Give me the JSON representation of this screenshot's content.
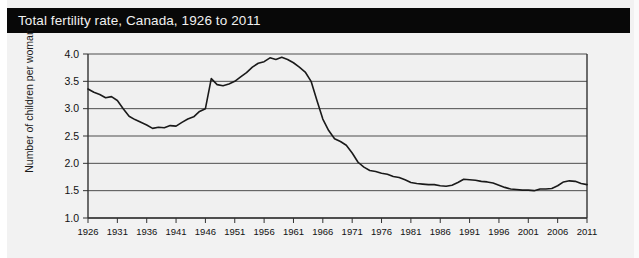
{
  "title": "Total fertility rate, Canada, 1926 to 2011",
  "axes": {
    "ylabel": "Number of children per woman",
    "yticks": [
      "1.0",
      "1.5",
      "2.0",
      "2.5",
      "3.0",
      "3.5",
      "4.0"
    ],
    "xticks": [
      "1926",
      "1931",
      "1936",
      "1941",
      "1946",
      "1951",
      "1956",
      "1961",
      "1966",
      "1971",
      "1976",
      "1981",
      "1986",
      "1991",
      "1996",
      "2001",
      "2006",
      "2011"
    ]
  },
  "colors": {
    "title_bar": "#080808",
    "title_text": "#f0f0f0",
    "figure_background": "#f2f2f2",
    "plot_background": "#f0f0f0",
    "line": "#1a1a1a",
    "grid": "#4d4d4d",
    "axis": "#333333"
  },
  "caption": "",
  "chart_data": {
    "type": "line",
    "title": "Total fertility rate, Canada, 1926 to 2011",
    "xlabel": "",
    "ylabel": "Number of children per woman",
    "xlim": [
      1926,
      2011
    ],
    "ylim": [
      1.0,
      4.0
    ],
    "ytick_step": 0.5,
    "xtick_step": 5,
    "grid": true,
    "legend": false,
    "series": [
      {
        "name": "Total fertility rate",
        "x": [
          1926,
          1927,
          1928,
          1929,
          1930,
          1931,
          1932,
          1933,
          1934,
          1935,
          1936,
          1937,
          1938,
          1939,
          1940,
          1941,
          1942,
          1943,
          1944,
          1945,
          1946,
          1947,
          1948,
          1949,
          1950,
          1951,
          1952,
          1953,
          1954,
          1955,
          1956,
          1957,
          1958,
          1959,
          1960,
          1961,
          1962,
          1963,
          1964,
          1965,
          1966,
          1967,
          1968,
          1969,
          1970,
          1971,
          1972,
          1973,
          1974,
          1975,
          1976,
          1977,
          1978,
          1979,
          1980,
          1981,
          1982,
          1983,
          1984,
          1985,
          1986,
          1987,
          1988,
          1989,
          1990,
          1991,
          1992,
          1993,
          1994,
          1995,
          1996,
          1997,
          1998,
          1999,
          2000,
          2001,
          2002,
          2003,
          2004,
          2005,
          2006,
          2007,
          2008,
          2009,
          2010,
          2011
        ],
        "y": [
          3.36,
          3.3,
          3.26,
          3.2,
          3.22,
          3.15,
          3.0,
          2.86,
          2.8,
          2.75,
          2.7,
          2.64,
          2.66,
          2.65,
          2.69,
          2.68,
          2.75,
          2.81,
          2.85,
          2.95,
          3.0,
          3.55,
          3.44,
          3.42,
          3.45,
          3.5,
          3.58,
          3.66,
          3.76,
          3.83,
          3.86,
          3.93,
          3.9,
          3.94,
          3.9,
          3.84,
          3.76,
          3.67,
          3.5,
          3.15,
          2.81,
          2.6,
          2.45,
          2.4,
          2.33,
          2.19,
          2.02,
          1.93,
          1.87,
          1.85,
          1.82,
          1.8,
          1.76,
          1.74,
          1.7,
          1.65,
          1.63,
          1.62,
          1.61,
          1.61,
          1.59,
          1.58,
          1.6,
          1.65,
          1.71,
          1.7,
          1.69,
          1.67,
          1.66,
          1.64,
          1.6,
          1.56,
          1.53,
          1.52,
          1.51,
          1.51,
          1.5,
          1.53,
          1.53,
          1.54,
          1.59,
          1.66,
          1.68,
          1.67,
          1.63,
          1.61
        ]
      }
    ]
  }
}
